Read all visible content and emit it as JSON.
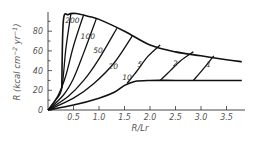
{
  "chart_data": {
    "type": "line",
    "title": "",
    "xlabel": "R/Lr",
    "ylabel": "R (kcal cm^-2 yr^-1)",
    "xlim": [
      0,
      3.85
    ],
    "ylim": [
      0,
      95
    ],
    "x_ticks": [
      "0.5",
      "1.0",
      "1.5",
      "2.0",
      "2.5",
      "3.0",
      "3.5"
    ],
    "y_ticks": [
      "0",
      "20",
      "40",
      "60",
      "80"
    ],
    "grid": false,
    "legend": "none (curves labeled inline)",
    "envelope_upper": {
      "name": "upper boundary",
      "x": [
        0.27,
        0.3,
        0.4,
        0.55,
        0.8,
        1.0,
        1.5,
        2.0,
        2.5,
        3.0,
        3.5,
        3.8
      ],
      "y": [
        22,
        90,
        97,
        98,
        95,
        92,
        80,
        66,
        59,
        55,
        51,
        49
      ]
    },
    "envelope_lower": {
      "name": "lower boundary",
      "x": [
        0.0,
        0.5,
        1.0,
        1.3,
        1.5,
        1.7,
        2.0,
        2.5,
        3.0,
        3.5,
        3.8
      ],
      "y": [
        0,
        5,
        12,
        18,
        25,
        29,
        30,
        30,
        30,
        30,
        30
      ]
    },
    "series": [
      {
        "name": "200",
        "x": [
          0.0,
          0.15,
          0.27,
          0.35,
          0.45
        ],
        "y": [
          0,
          10,
          22,
          62,
          98
        ]
      },
      {
        "name": "100",
        "x": [
          0.0,
          0.2,
          0.35,
          0.5,
          0.7
        ],
        "y": [
          0,
          15,
          35,
          65,
          97
        ]
      },
      {
        "name": "50",
        "x": [
          0.0,
          0.3,
          0.5,
          0.7,
          0.95
        ],
        "y": [
          0,
          15,
          32,
          58,
          93
        ]
      },
      {
        "name": "20",
        "x": [
          0.0,
          0.4,
          0.7,
          1.0,
          1.35
        ],
        "y": [
          0,
          14,
          30,
          52,
          83
        ]
      },
      {
        "name": "10",
        "x": [
          0.0,
          0.5,
          0.9,
          1.3,
          1.65
        ],
        "y": [
          0,
          12,
          27,
          48,
          75
        ]
      },
      {
        "name": "5",
        "x": [
          1.55,
          1.75,
          1.95,
          2.2
        ],
        "y": [
          27,
          40,
          54,
          66
        ]
      },
      {
        "name": "2",
        "x": [
          2.2,
          2.4,
          2.6,
          2.85
        ],
        "y": [
          30,
          40,
          50,
          59
        ]
      },
      {
        "name": "1",
        "x": [
          2.85,
          3.05,
          3.25
        ],
        "y": [
          30,
          42,
          55
        ]
      }
    ]
  }
}
